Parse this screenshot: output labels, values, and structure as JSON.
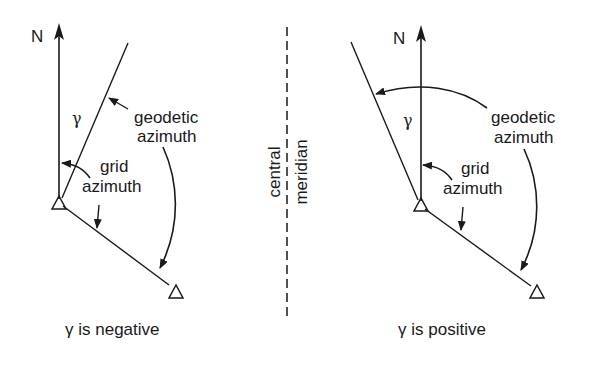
{
  "figure": {
    "colors": {
      "ink": "#1a1a1a",
      "background": "#ffffff"
    },
    "central_meridian": {
      "label_left": "central",
      "label_right": "meridian"
    },
    "left_panel": {
      "north_label": "N",
      "gamma_label": "γ",
      "geodetic_label_line1": "geodetic",
      "geodetic_label_line2": "azimuth",
      "grid_label_line1": "grid",
      "grid_label_line2": "azimuth",
      "caption": "γ is negative"
    },
    "right_panel": {
      "north_label": "N",
      "gamma_label": "γ",
      "geodetic_label_line1": "geodetic",
      "geodetic_label_line2": "azimuth",
      "grid_label_line1": "grid",
      "grid_label_line2": "azimuth",
      "caption": "γ is positive"
    }
  }
}
